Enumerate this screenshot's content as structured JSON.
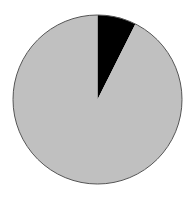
{
  "chart_data": {
    "type": "pie",
    "title": "",
    "categories": [
      "Slice A",
      "Slice B"
    ],
    "values": [
      7.4,
      92.6
    ],
    "colors": [
      "#000000",
      "#c0c0c0"
    ],
    "start_angle_deg": 0,
    "direction": "clockwise",
    "legend": "none",
    "labels_shown": false,
    "center": [
      97.5,
      99.5
    ],
    "radius": 84.5,
    "outline_color": "#555555"
  }
}
